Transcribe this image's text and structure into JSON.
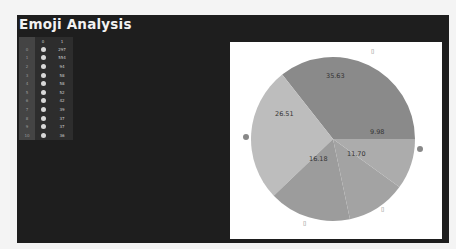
{
  "app": {
    "title": "Emoji Analysis"
  },
  "table": {
    "columns": [
      "",
      "0",
      "1"
    ],
    "rows": [
      {
        "index": "0",
        "emoji": "emoji-face",
        "count": "297"
      },
      {
        "index": "1",
        "emoji": "emoji-face",
        "count": "554"
      },
      {
        "index": "2",
        "emoji": "emoji-box",
        "count": "94"
      },
      {
        "index": "3",
        "emoji": "emoji-hand",
        "count": "58"
      },
      {
        "index": "4",
        "emoji": "emoji-face",
        "count": "58"
      },
      {
        "index": "5",
        "emoji": "emoji-heart",
        "count": "52"
      },
      {
        "index": "6",
        "emoji": "emoji-face",
        "count": "42"
      },
      {
        "index": "7",
        "emoji": "emoji-face",
        "count": "39"
      },
      {
        "index": "8",
        "emoji": "emoji-face",
        "count": "37"
      },
      {
        "index": "9",
        "emoji": "emoji-face",
        "count": "37"
      },
      {
        "index": "10",
        "emoji": "emoji-hand",
        "count": "36"
      }
    ]
  },
  "chart_data": {
    "type": "pie",
    "title": "",
    "categories": [
      "missing-glyph-top",
      "emoji-face-left",
      "missing-glyph-bottom-left",
      "missing-glyph-bottom-right",
      "emoji-face-right"
    ],
    "values": [
      35.63,
      26.51,
      16.18,
      11.7,
      9.98
    ],
    "labels": [
      "35.63",
      "26.51",
      "16.18",
      "11.70",
      "9.98"
    ],
    "colors": [
      "#8a8a8a",
      "#bdbdbd",
      "#9c9c9c",
      "#a3a3a3",
      "#acacac"
    ]
  }
}
